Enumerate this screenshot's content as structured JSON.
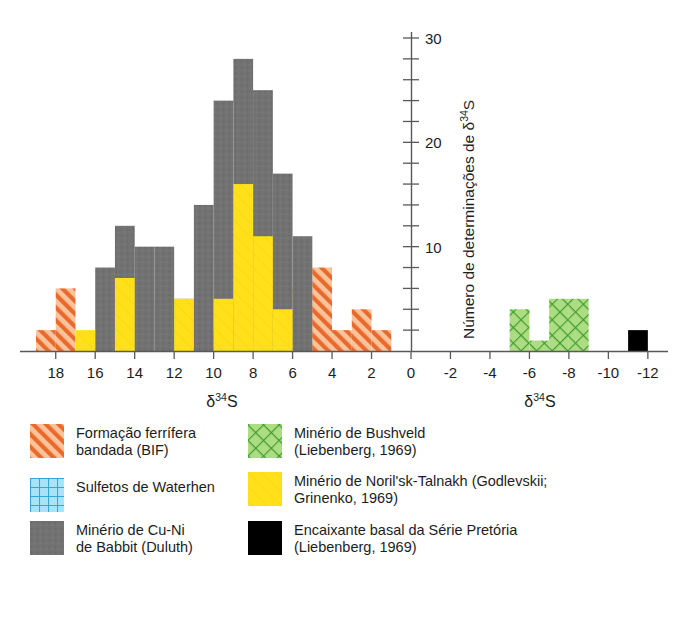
{
  "chart_data": {
    "type": "bar",
    "title": "",
    "subtitle": "",
    "xlabel": "δ34S",
    "ylabel": "Número de determinações de δ34S",
    "ylim": [
      0,
      31
    ],
    "ytick_step": 2,
    "ytick_labels": [
      10,
      20,
      30
    ],
    "grid": false,
    "legend_position": "below",
    "panels": [
      {
        "name": "left-panel",
        "xlim": [
          19,
          0
        ],
        "xtick_labels": [
          "18",
          "16",
          "14",
          "12",
          "10",
          "8",
          "6",
          "4",
          "2",
          "0"
        ],
        "xtick_values": [
          18,
          16,
          14,
          12,
          10,
          8,
          6,
          4,
          2,
          0
        ]
      },
      {
        "name": "right-panel",
        "xlim": [
          0,
          -12
        ],
        "xtick_labels": [
          "0",
          "-2",
          "-4",
          "-6",
          "-8",
          "-10",
          "-12"
        ],
        "xtick_values": [
          0,
          -2,
          -4,
          -6,
          -8,
          -10,
          -12
        ]
      }
    ],
    "bin_width": 1,
    "series": [
      {
        "name": "Formação ferrífera bandada (BIF)",
        "key": "bif",
        "color": "#f6ad7f",
        "pattern": "diagonal-hatch",
        "hatch_color": "#e8622a",
        "bins": [
          {
            "x0": 19,
            "x1": 18,
            "value": 2
          },
          {
            "x0": 18,
            "x1": 17,
            "value": 6
          },
          {
            "x0": 17,
            "x1": 16,
            "value": 0
          },
          {
            "x0": 16,
            "x1": 15,
            "value": 0
          },
          {
            "x0": 15,
            "x1": 14,
            "value": 0
          },
          {
            "x0": 14,
            "x1": 13,
            "value": 0
          },
          {
            "x0": 13,
            "x1": 12,
            "value": 0
          },
          {
            "x0": 12,
            "x1": 11,
            "value": 0
          },
          {
            "x0": 11,
            "x1": 10,
            "value": 2
          },
          {
            "x0": 10,
            "x1": 9,
            "value": 2
          },
          {
            "x0": 9,
            "x1": 8,
            "value": 3
          },
          {
            "x0": 8,
            "x1": 7,
            "value": 3
          },
          {
            "x0": 7,
            "x1": 6,
            "value": 4
          },
          {
            "x0": 6,
            "x1": 5,
            "value": 6
          },
          {
            "x0": 5,
            "x1": 4,
            "value": 8
          },
          {
            "x0": 4,
            "x1": 3,
            "value": 2
          },
          {
            "x0": 3,
            "x1": 2,
            "value": 4
          },
          {
            "x0": 2,
            "x1": 1,
            "value": 2
          }
        ]
      },
      {
        "name": "Sulfetos de Waterhen",
        "key": "waterhen",
        "color": "#7fd3f2",
        "pattern": "grid-hatch",
        "hatch_color": "#2e9fd4",
        "bins": [
          {
            "x0": 16,
            "x1": 15,
            "value": 2
          },
          {
            "x0": 15,
            "x1": 14,
            "value": 5
          },
          {
            "x0": 14,
            "x1": 13,
            "value": 5
          },
          {
            "x0": 12,
            "x1": 11,
            "value": 2
          }
        ]
      },
      {
        "name": "Minério de Cu-Ni de Babbit (Duluth)",
        "key": "babbit",
        "color": "#6e6e6e",
        "pattern": "solid",
        "hatch_color": "#6e6e6e",
        "bins": [
          {
            "x0": 16,
            "x1": 15,
            "value": 8
          },
          {
            "x0": 15,
            "x1": 14,
            "value": 12
          },
          {
            "x0": 14,
            "x1": 13,
            "value": 10
          },
          {
            "x0": 13,
            "x1": 12,
            "value": 10
          },
          {
            "x0": 12,
            "x1": 11,
            "value": 5
          },
          {
            "x0": 11,
            "x1": 10,
            "value": 14
          },
          {
            "x0": 10,
            "x1": 9,
            "value": 24
          },
          {
            "x0": 9,
            "x1": 8,
            "value": 28
          },
          {
            "x0": 8,
            "x1": 7,
            "value": 25
          },
          {
            "x0": 7,
            "x1": 6,
            "value": 17
          },
          {
            "x0": 6,
            "x1": 5,
            "value": 11
          }
        ]
      },
      {
        "name": "Minério de Noril'sk-Talnakh (Godlevskii; Grinenko, 1969)",
        "key": "norilsk",
        "color": "#ffe01b",
        "pattern": "faint-hatch",
        "hatch_color": "#f2d400",
        "bins": [
          {
            "x0": 17,
            "x1": 16,
            "value": 2
          },
          {
            "x0": 15,
            "x1": 14,
            "value": 7
          },
          {
            "x0": 12,
            "x1": 11,
            "value": 5
          },
          {
            "x0": 10,
            "x1": 9,
            "value": 5
          },
          {
            "x0": 9,
            "x1": 8,
            "value": 16
          },
          {
            "x0": 8,
            "x1": 7,
            "value": 11
          },
          {
            "x0": 7,
            "x1": 6,
            "value": 4
          }
        ]
      },
      {
        "name": "Minério de Bushveld (Liebenberg, 1969)",
        "key": "bushveld",
        "color": "#a8db7f",
        "pattern": "cross-hatch",
        "hatch_color": "#45a52c",
        "bins": [
          {
            "x0": -5,
            "x1": -6,
            "value": 4
          },
          {
            "x0": -6,
            "x1": -7,
            "value": 1
          },
          {
            "x0": -7,
            "x1": -8,
            "value": 5
          },
          {
            "x0": -8,
            "x1": -9,
            "value": 5
          }
        ]
      },
      {
        "name": "Encaixante basal da Série Pretória (Liebenberg, 1969)",
        "key": "pretoria",
        "color": "#000000",
        "pattern": "solid",
        "hatch_color": "#000000",
        "bins": [
          {
            "x0": -11,
            "x1": -12,
            "value": 2
          }
        ]
      }
    ]
  },
  "axes": {
    "y_axis_title_prefix": "Número de determinações de δ",
    "y_axis_title_sup": "34",
    "y_axis_title_suffix": "S",
    "x_axis_title_prefix": "δ",
    "x_axis_title_sup": "34",
    "x_axis_title_suffix": "S"
  },
  "legend": {
    "items": [
      {
        "id": "bif",
        "label": "Formação ferrífera\nbandada (BIF)",
        "swatch": "orange-diagonal-hatch-swatch"
      },
      {
        "id": "waterhen",
        "label": "Sulfetos de Waterhen",
        "swatch": "blue-grid-swatch"
      },
      {
        "id": "babbit",
        "label": "Minério de Cu-Ni\nde Babbit (Duluth)",
        "swatch": "gray-solid-swatch"
      },
      {
        "id": "bushveld",
        "label": "Minério de Bushveld\n(Liebenberg, 1969)",
        "swatch": "green-cross-hatch-swatch"
      },
      {
        "id": "norilsk",
        "label": "Minério de Noril'sk-Talnakh (Godlevskii;\nGrinenko, 1969)",
        "swatch": "yellow-solid-swatch"
      },
      {
        "id": "pretoria",
        "label": "Encaixante basal da Série Pretória\n(Liebenberg, 1969)",
        "swatch": "black-solid-swatch"
      }
    ]
  }
}
